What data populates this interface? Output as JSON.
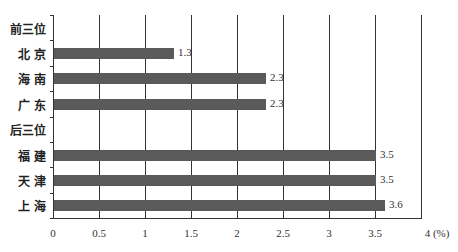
{
  "chart_data": {
    "type": "bar",
    "orientation": "horizontal",
    "title": "",
    "xlabel": "",
    "ylabel": "",
    "x_unit": "(%)",
    "xlim": [
      0,
      4
    ],
    "x_ticks": [
      "0",
      "0.5",
      "1",
      "1.5",
      "2",
      "2.5",
      "3",
      "3.5",
      "4 (%)"
    ],
    "grid": true,
    "legend": null,
    "categories": [
      "前三位",
      "北 京",
      "海 南",
      "广 东",
      "后三位",
      "福 建",
      "天 津",
      "上 海"
    ],
    "values": [
      null,
      1.3,
      2.3,
      2.3,
      null,
      3.5,
      3.5,
      3.6
    ],
    "value_labels": [
      "",
      "1.3",
      "2.3",
      "2.3",
      "",
      "3.5",
      "3.5",
      "3.6"
    ],
    "colors": {
      "bar": "#5a5a5a",
      "grid": "#333333"
    }
  }
}
